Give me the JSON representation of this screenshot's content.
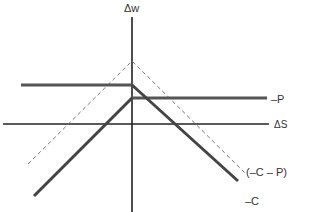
{
  "diagram": {
    "axes": {
      "y_label": "Δw",
      "x_label": "ΔS"
    },
    "curves": [
      {
        "id": "minus_p",
        "label": "–P",
        "style": "solid"
      },
      {
        "id": "minus_c_minus_p",
        "label": "(–C – P)",
        "style": "dashed"
      },
      {
        "id": "minus_c",
        "label": "–C",
        "style": "solid"
      }
    ],
    "colors": {
      "axis": "#222222",
      "line": "#444444",
      "dashed": "#777777",
      "text": "#333333"
    }
  }
}
